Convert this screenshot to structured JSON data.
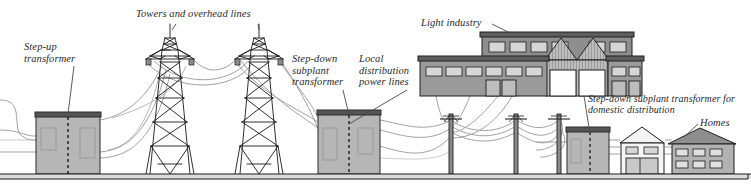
{
  "diagram": {
    "type": "schematic-illustration",
    "palette": {
      "ink": "#1a1a1a",
      "label_text": "#2a2a2a",
      "transformer_fill": "#b6b6b6",
      "transformer_top": "#4a4a4a",
      "building_fill": "#9a9a9a",
      "building_roof": "#6e6e6e",
      "window_fill": "#d9d9d9",
      "house_light_fill": "#f2f2f2",
      "wire": "#9c9c9c",
      "ground": "#cfcfcf",
      "leader": "#5a5a5a"
    },
    "labels": [
      {
        "id": "step-up-transformer",
        "text": "Step-up\ntransformer",
        "x": 24,
        "y": 41
      },
      {
        "id": "towers-overhead-lines",
        "text": "Towers and overhead lines",
        "x": 136,
        "y": 8
      },
      {
        "id": "step-down-subplant",
        "text": "Step-down\nsubplant\ntransformer",
        "x": 292,
        "y": 53
      },
      {
        "id": "local-distribution",
        "text": "Local\ndistribution\npower lines",
        "x": 359,
        "y": 53
      },
      {
        "id": "light-industry",
        "text": "Light industry",
        "x": 421,
        "y": 17
      },
      {
        "id": "domestic-transformer",
        "text": "Step-down subplant transformer for\ndomestic distribution",
        "x": 588,
        "y": 93
      },
      {
        "id": "homes",
        "text": "Homes",
        "x": 700,
        "y": 117
      }
    ],
    "elements": {
      "step_up_transformer": {
        "label": "Step-up transformer",
        "x": 36,
        "y": 112,
        "w": 64,
        "h": 62
      },
      "tower_left": {
        "label": "Transmission tower",
        "x": 170,
        "base_y": 174,
        "top_y": 24
      },
      "tower_right": {
        "label": "Transmission tower",
        "x": 259,
        "base_y": 174,
        "top_y": 24
      },
      "step_down_subplant": {
        "label": "Step-down subplant transformer",
        "x": 318,
        "y": 110,
        "w": 62,
        "h": 64
      },
      "light_industry": {
        "label": "Light industry factory",
        "x": 420,
        "y": 30,
        "w": 222,
        "h": 66
      },
      "utility_pole_1": {
        "label": "Utility pole",
        "x": 451,
        "base_y": 174
      },
      "utility_pole_2": {
        "label": "Utility pole",
        "x": 516,
        "base_y": 174
      },
      "utility_pole_3": {
        "label": "Utility pole",
        "x": 559,
        "base_y": 174
      },
      "domestic_transformer": {
        "label": "Domestic step-down transformer",
        "x": 567,
        "y": 127,
        "w": 42,
        "h": 47
      },
      "house_small": {
        "label": "Home with garage",
        "x": 620,
        "y": 131,
        "w": 45,
        "h": 43
      },
      "house_large": {
        "label": "Home",
        "x": 672,
        "y": 128,
        "w": 62,
        "h": 46
      },
      "ground_line": {
        "label": "Ground",
        "y": 174
      }
    }
  }
}
